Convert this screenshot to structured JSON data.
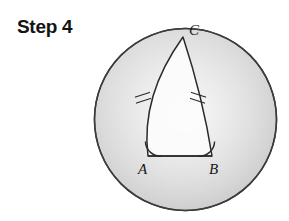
{
  "figure": {
    "caption": "Step 4",
    "type": "geometry-construction",
    "colors": {
      "background": "#ffffff",
      "circle_fill_outer": "#d9d9d9",
      "circle_fill_inner": "#f2f2f2",
      "circle_stroke": "#3a3a3a",
      "triangle_fill": "#fbfbfb",
      "triangle_stroke": "#2b2b2b",
      "text": "#141414"
    },
    "circle": {
      "name": "construction-circle",
      "cx": 185.5,
      "cy": 119.5,
      "r": 91.5
    },
    "triangle": {
      "name": "inscribed-triangle",
      "vertices": [
        {
          "id": "A",
          "label": "A",
          "x": 148,
          "y": 156,
          "label_x": 141,
          "label_y": 172
        },
        {
          "id": "B",
          "label": "B",
          "x": 212,
          "y": 156,
          "label_x": 211,
          "label_y": 172
        },
        {
          "id": "C",
          "label": "C",
          "x": 183,
          "y": 37,
          "label_x": 190,
          "label_y": 34
        }
      ],
      "legs": [
        {
          "from": "A",
          "to": "C",
          "tick_marks": 2,
          "curve_control_x": 139,
          "curve_control_y": 95
        },
        {
          "from": "B",
          "to": "C",
          "tick_marks": 2,
          "curve_control_x": 202,
          "curve_control_y": 95
        }
      ],
      "base": {
        "from": "A",
        "to": "B"
      },
      "angle_arcs": [
        {
          "at": "A",
          "radius": 15
        },
        {
          "at": "B",
          "radius": 15
        }
      ]
    }
  }
}
